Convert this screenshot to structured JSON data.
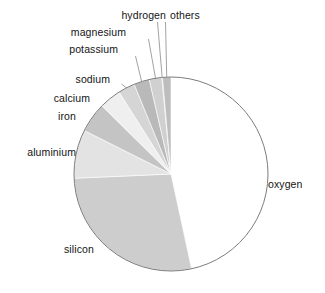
{
  "chart_data": {
    "type": "pie",
    "title": "",
    "subtitle": "",
    "xlabel": "",
    "ylabel": "",
    "legend_position": "none",
    "grid": false,
    "units": "percent by mass",
    "start_angle_deg": 0,
    "direction": "clockwise",
    "categories": [
      "oxygen",
      "silicon",
      "aluminium",
      "iron",
      "calcium",
      "sodium",
      "potassium",
      "magnesium",
      "hydrogen",
      "others"
    ],
    "values": [
      46.6,
      27.7,
      8.1,
      5.0,
      3.6,
      2.8,
      2.6,
      2.1,
      0.1,
      1.4
    ],
    "slices": [
      {
        "label": "oxygen",
        "value": 46.6,
        "color": "#ffffff"
      },
      {
        "label": "silicon",
        "value": 27.7,
        "color": "#cdcdcd"
      },
      {
        "label": "aluminium",
        "value": 8.1,
        "color": "#e3e3e3"
      },
      {
        "label": "iron",
        "value": 5.0,
        "color": "#c4c4c4"
      },
      {
        "label": "calcium",
        "value": 3.6,
        "color": "#efefef"
      },
      {
        "label": "sodium",
        "value": 2.8,
        "color": "#d5d5d5"
      },
      {
        "label": "potassium",
        "value": 2.6,
        "color": "#b9b9b9"
      },
      {
        "label": "magnesium",
        "value": 2.1,
        "color": "#d0d0d0"
      },
      {
        "label": "hydrogen",
        "value": 0.1,
        "color": "#a8a8a8"
      },
      {
        "label": "others",
        "value": 1.4,
        "color": "#bdbdbd"
      }
    ]
  },
  "labels": {
    "oxygen": "oxygen",
    "silicon": "silicon",
    "aluminium": "aluminium",
    "iron": "iron",
    "calcium": "calcium",
    "sodium": "sodium",
    "potassium": "potassium",
    "magnesium": "magnesium",
    "hydrogen": "hydrogen",
    "others": "others"
  },
  "style": {
    "outline_color": "#7d7d7d",
    "leader_line_color": "#8a8a8a",
    "text_color": "#141414",
    "background": "#ffffff"
  },
  "geometry": {
    "center_x": 171,
    "center_y": 174,
    "radius": 97
  }
}
